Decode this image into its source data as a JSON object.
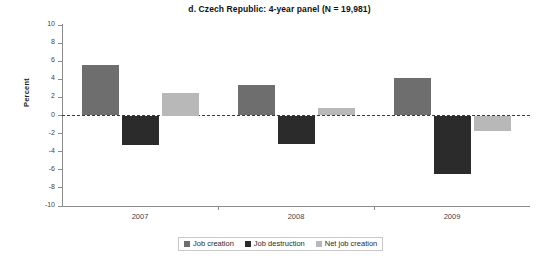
{
  "chart_data": {
    "type": "bar",
    "title": "d. Czech Republic: 4-year panel (N = 19,981)",
    "xlabel": "",
    "ylabel": "Percent",
    "ylim": [
      -10,
      10
    ],
    "yticks": [
      10,
      8,
      6,
      4,
      2,
      0,
      -2,
      -4,
      -6,
      -8,
      -10
    ],
    "ytick_labels": [
      "10",
      "8",
      "6",
      "4",
      "2",
      "0",
      "-2",
      "-4",
      "-6",
      "-8",
      "-10"
    ],
    "grid": false,
    "zero_line": true,
    "categories": [
      "2007",
      "2008",
      "2009"
    ],
    "legend_position": "bottom",
    "series": [
      {
        "name": "Job creation",
        "color": "#6e6e6e",
        "values": [
          5.6,
          3.4,
          4.1
        ]
      },
      {
        "name": "Job destruction",
        "color": "#2b2b2b",
        "values": [
          -3.3,
          -3.2,
          -6.5
        ]
      },
      {
        "name": "Net job creation",
        "color": "#b8b8b8",
        "values": [
          2.5,
          0.8,
          -1.7
        ]
      }
    ]
  }
}
